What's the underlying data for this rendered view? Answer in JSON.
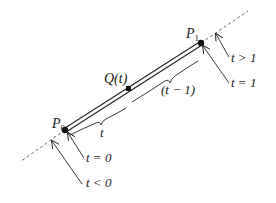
{
  "diagram": {
    "points": {
      "p0": {
        "label": "P",
        "sub": "0"
      },
      "p1": {
        "label": "P",
        "sub": "1"
      },
      "q": {
        "label": "Q(t)"
      }
    },
    "segments": {
      "t_label": "t",
      "t_minus_1_label": "(t − 1)"
    },
    "arrows": {
      "t_gt_1": "t > 1",
      "t_eq_1": "t = 1",
      "t_eq_0": "t = 0",
      "t_lt_0": "t < 0"
    },
    "colors": {
      "ink": "#222222",
      "background": "#ffffff"
    }
  }
}
